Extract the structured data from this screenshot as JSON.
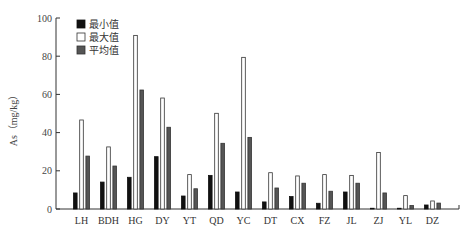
{
  "chart_data": {
    "type": "bar",
    "title": "",
    "xlabel": "",
    "ylabel": "As（mg/kg）",
    "ylim": [
      0,
      100
    ],
    "yticks": [
      0,
      20,
      40,
      60,
      80,
      100
    ],
    "grid": false,
    "legend_position": "upper-left",
    "categories": [
      "LH",
      "BDH",
      "HG",
      "DY",
      "YT",
      "QD",
      "YC",
      "DT",
      "CX",
      "FZ",
      "JL",
      "ZJ",
      "YL",
      "DZ"
    ],
    "series": [
      {
        "name": "最小值",
        "color": "#111111",
        "stroke": "#111111",
        "values": [
          8.4,
          14.1,
          16.6,
          27.4,
          6.8,
          17.6,
          8.9,
          3.7,
          6.5,
          3.0,
          8.9,
          0.4,
          0.4,
          2.1
        ]
      },
      {
        "name": "最大值",
        "color": "#ffffff",
        "stroke": "#333333",
        "values": [
          46.6,
          32.5,
          90.9,
          58.1,
          18.0,
          50.1,
          79.4,
          19.0,
          17.3,
          18.0,
          17.6,
          29.6,
          7.0,
          4.2
        ]
      },
      {
        "name": "平均值",
        "color": "#555555",
        "stroke": "#333333",
        "values": [
          27.7,
          22.5,
          62.3,
          42.8,
          10.6,
          34.4,
          37.5,
          11.0,
          13.5,
          9.3,
          13.5,
          8.4,
          1.8,
          3.1
        ]
      }
    ]
  }
}
